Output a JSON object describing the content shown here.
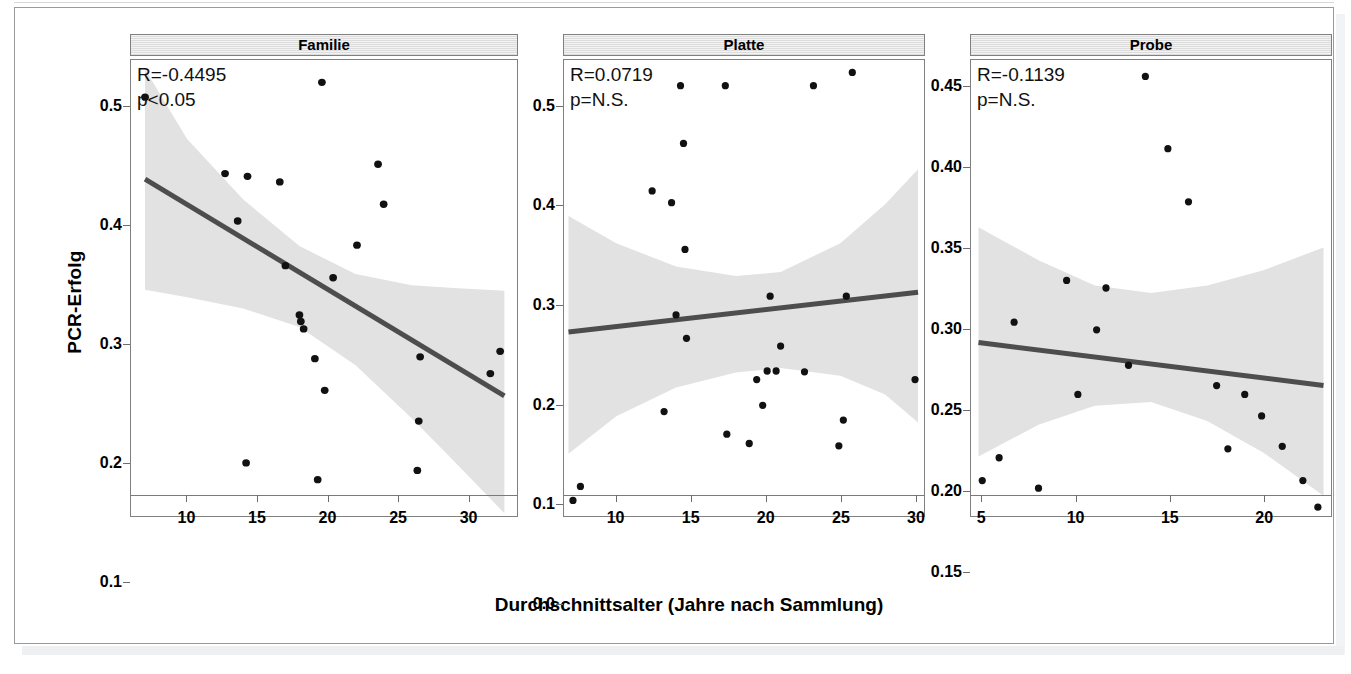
{
  "figure": {
    "ylabel": "PCR-Erfolg",
    "xlabel": "Durchschnittsalter (Jahre nach Sammlung)"
  },
  "chart_data": {
    "type": "scatter",
    "title": "",
    "xlabel": "Durchschnittsalter (Jahre nach Sammlung)",
    "ylabel": "PCR-Erfolg",
    "grid": false,
    "legend": "none",
    "facets": [
      {
        "label": "Familie",
        "annotation_r": "R=-0.4495",
        "annotation_p": "p<0.05",
        "r_value": -0.4495,
        "p_text": "p<0.05",
        "xlim": [
          6.0,
          33.5
        ],
        "ylim": [
          0.065,
          0.555
        ],
        "xticks": [
          10,
          15,
          20,
          25,
          30
        ],
        "yticks": [
          0.1,
          0.2,
          0.3,
          0.4,
          0.5
        ],
        "ytick_labels": [
          "0.1",
          "0.2",
          "0.3",
          "0.4",
          "0.5"
        ],
        "points": [
          {
            "x": 7.0,
            "y": 0.515
          },
          {
            "x": 12.7,
            "y": 0.433
          },
          {
            "x": 13.6,
            "y": 0.382
          },
          {
            "x": 14.2,
            "y": 0.122
          },
          {
            "x": 14.3,
            "y": 0.43
          },
          {
            "x": 16.6,
            "y": 0.424
          },
          {
            "x": 17.0,
            "y": 0.334
          },
          {
            "x": 18.0,
            "y": 0.281
          },
          {
            "x": 18.1,
            "y": 0.274
          },
          {
            "x": 18.3,
            "y": 0.266
          },
          {
            "x": 19.1,
            "y": 0.234
          },
          {
            "x": 19.3,
            "y": 0.104
          },
          {
            "x": 19.6,
            "y": 0.531
          },
          {
            "x": 19.8,
            "y": 0.2
          },
          {
            "x": 20.4,
            "y": 0.321
          },
          {
            "x": 22.1,
            "y": 0.356
          },
          {
            "x": 23.6,
            "y": 0.443
          },
          {
            "x": 24.0,
            "y": 0.4
          },
          {
            "x": 26.4,
            "y": 0.114
          },
          {
            "x": 26.5,
            "y": 0.167
          },
          {
            "x": 26.6,
            "y": 0.236
          },
          {
            "x": 31.6,
            "y": 0.218
          },
          {
            "x": 32.3,
            "y": 0.242
          }
        ],
        "fit_line": {
          "x0": 7.0,
          "y0": 0.427,
          "x1": 32.6,
          "y1": 0.194
        },
        "band_upper": [
          {
            "x": 7.0,
            "y": 0.545
          },
          {
            "x": 10.0,
            "y": 0.47
          },
          {
            "x": 14.0,
            "y": 0.405
          },
          {
            "x": 18.0,
            "y": 0.355
          },
          {
            "x": 22.0,
            "y": 0.325
          },
          {
            "x": 26.0,
            "y": 0.313
          },
          {
            "x": 29.0,
            "y": 0.31
          },
          {
            "x": 32.6,
            "y": 0.307
          }
        ],
        "band_lower": [
          {
            "x": 7.0,
            "y": 0.308
          },
          {
            "x": 10.0,
            "y": 0.3
          },
          {
            "x": 14.0,
            "y": 0.288
          },
          {
            "x": 18.0,
            "y": 0.268
          },
          {
            "x": 22.0,
            "y": 0.227
          },
          {
            "x": 26.0,
            "y": 0.17
          },
          {
            "x": 29.0,
            "y": 0.124
          },
          {
            "x": 32.6,
            "y": 0.068
          }
        ]
      },
      {
        "label": "Platte",
        "annotation_r": "R=0.0719",
        "annotation_p": "p=N.S.",
        "r_value": 0.0719,
        "p_text": "p=N.S.",
        "xlim": [
          6.5,
          30.6
        ],
        "ylim": [
          -0.02,
          0.565
        ],
        "xticks": [
          10,
          15,
          20,
          25,
          30
        ],
        "yticks": [
          0.0,
          0.1,
          0.2,
          0.3,
          0.4,
          0.5
        ],
        "ytick_labels": [
          "0.0",
          "0.1",
          "0.2",
          "0.3",
          "0.4",
          "0.5"
        ],
        "points": [
          {
            "x": 7.1,
            "y": 0.0
          },
          {
            "x": 7.6,
            "y": 0.018
          },
          {
            "x": 12.4,
            "y": 0.397
          },
          {
            "x": 13.2,
            "y": 0.114
          },
          {
            "x": 13.7,
            "y": 0.382
          },
          {
            "x": 14.0,
            "y": 0.238
          },
          {
            "x": 14.3,
            "y": 0.532
          },
          {
            "x": 14.5,
            "y": 0.458
          },
          {
            "x": 14.6,
            "y": 0.322
          },
          {
            "x": 14.7,
            "y": 0.208
          },
          {
            "x": 17.3,
            "y": 0.532
          },
          {
            "x": 17.4,
            "y": 0.085
          },
          {
            "x": 18.9,
            "y": 0.073
          },
          {
            "x": 19.4,
            "y": 0.155
          },
          {
            "x": 19.8,
            "y": 0.122
          },
          {
            "x": 20.1,
            "y": 0.166
          },
          {
            "x": 20.3,
            "y": 0.262
          },
          {
            "x": 20.7,
            "y": 0.166
          },
          {
            "x": 21.0,
            "y": 0.198
          },
          {
            "x": 22.6,
            "y": 0.165
          },
          {
            "x": 23.2,
            "y": 0.532
          },
          {
            "x": 24.9,
            "y": 0.07
          },
          {
            "x": 25.2,
            "y": 0.103
          },
          {
            "x": 25.4,
            "y": 0.262
          },
          {
            "x": 25.8,
            "y": 0.549
          },
          {
            "x": 30.0,
            "y": 0.155
          }
        ],
        "fit_line": {
          "x0": 6.8,
          "y0": 0.216,
          "x1": 30.2,
          "y1": 0.267
        },
        "band_upper": [
          {
            "x": 6.8,
            "y": 0.365
          },
          {
            "x": 10.0,
            "y": 0.33
          },
          {
            "x": 14.0,
            "y": 0.3
          },
          {
            "x": 18.0,
            "y": 0.288
          },
          {
            "x": 21.0,
            "y": 0.293
          },
          {
            "x": 25.0,
            "y": 0.33
          },
          {
            "x": 28.0,
            "y": 0.38
          },
          {
            "x": 30.2,
            "y": 0.425
          }
        ],
        "band_lower": [
          {
            "x": 6.8,
            "y": 0.06
          },
          {
            "x": 10.0,
            "y": 0.108
          },
          {
            "x": 14.0,
            "y": 0.145
          },
          {
            "x": 18.0,
            "y": 0.164
          },
          {
            "x": 21.0,
            "y": 0.17
          },
          {
            "x": 25.0,
            "y": 0.16
          },
          {
            "x": 28.0,
            "y": 0.136
          },
          {
            "x": 30.2,
            "y": 0.1
          }
        ]
      },
      {
        "label": "Probe",
        "annotation_r": "R=-0.1139",
        "annotation_p": "p=N.S.",
        "r_value": -0.1139,
        "p_text": "p=N.S.",
        "xlim": [
          4.4,
          23.6
        ],
        "ylim": [
          0.118,
          0.478
        ],
        "xticks": [
          5,
          10,
          15,
          20
        ],
        "yticks": [
          0.15,
          0.2,
          0.25,
          0.3,
          0.35,
          0.4,
          0.45
        ],
        "ytick_labels": [
          "0.15",
          "0.20",
          "0.25",
          "0.30",
          "0.35",
          "0.40",
          "0.45"
        ],
        "points": [
          {
            "x": 5.0,
            "y": 0.146
          },
          {
            "x": 5.9,
            "y": 0.164
          },
          {
            "x": 6.7,
            "y": 0.271
          },
          {
            "x": 8.0,
            "y": 0.14
          },
          {
            "x": 9.5,
            "y": 0.304
          },
          {
            "x": 10.1,
            "y": 0.214
          },
          {
            "x": 11.1,
            "y": 0.265
          },
          {
            "x": 11.6,
            "y": 0.298
          },
          {
            "x": 12.8,
            "y": 0.237
          },
          {
            "x": 13.7,
            "y": 0.465
          },
          {
            "x": 14.9,
            "y": 0.408
          },
          {
            "x": 16.0,
            "y": 0.366
          },
          {
            "x": 17.5,
            "y": 0.221
          },
          {
            "x": 18.1,
            "y": 0.171
          },
          {
            "x": 19.0,
            "y": 0.214
          },
          {
            "x": 19.9,
            "y": 0.197
          },
          {
            "x": 21.0,
            "y": 0.173
          },
          {
            "x": 22.1,
            "y": 0.146
          },
          {
            "x": 22.9,
            "y": 0.125
          }
        ],
        "fit_line": {
          "x0": 4.8,
          "y0": 0.255,
          "x1": 23.2,
          "y1": 0.221
        },
        "band_upper": [
          {
            "x": 4.8,
            "y": 0.346
          },
          {
            "x": 8.0,
            "y": 0.32
          },
          {
            "x": 11.0,
            "y": 0.3
          },
          {
            "x": 14.0,
            "y": 0.294
          },
          {
            "x": 17.0,
            "y": 0.3
          },
          {
            "x": 20.0,
            "y": 0.312
          },
          {
            "x": 23.2,
            "y": 0.33
          }
        ],
        "band_lower": [
          {
            "x": 4.8,
            "y": 0.165
          },
          {
            "x": 8.0,
            "y": 0.19
          },
          {
            "x": 11.0,
            "y": 0.205
          },
          {
            "x": 14.0,
            "y": 0.208
          },
          {
            "x": 17.0,
            "y": 0.193
          },
          {
            "x": 20.0,
            "y": 0.168
          },
          {
            "x": 23.2,
            "y": 0.134
          }
        ]
      }
    ]
  }
}
